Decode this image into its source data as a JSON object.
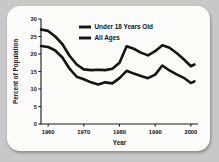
{
  "chart_data": {
    "type": "line",
    "title": "",
    "xlabel": "Year",
    "ylabel": "Percent of Population",
    "xlim": [
      1958,
      2002
    ],
    "ylim": [
      0,
      30
    ],
    "grid": false,
    "legend_position": "top-center",
    "xticks": [
      "1960",
      "1970",
      "1980",
      "1990",
      "2000"
    ],
    "xtick_values": [
      1960,
      1970,
      1980,
      1990,
      2000
    ],
    "yticks": [
      "0",
      "5",
      "10",
      "15",
      "20",
      "25",
      "30"
    ],
    "ytick_values": [
      0,
      5,
      10,
      15,
      20,
      25,
      30
    ],
    "series": [
      {
        "name": "Under 18 Years Old",
        "x": [
          1958,
          1960,
          1962,
          1964,
          1966,
          1968,
          1970,
          1972,
          1974,
          1976,
          1978,
          1980,
          1982,
          1984,
          1986,
          1988,
          1990,
          1992,
          1994,
          1996,
          1998,
          2000,
          2001
        ],
        "values": [
          27.0,
          26.6,
          25.0,
          22.8,
          19.5,
          17.0,
          15.6,
          15.4,
          15.5,
          15.4,
          15.8,
          17.5,
          22.2,
          21.5,
          20.4,
          19.6,
          20.8,
          22.5,
          21.8,
          20.3,
          18.5,
          16.5,
          17.0
        ]
      },
      {
        "name": "All Ages",
        "x": [
          1958,
          1960,
          1962,
          1964,
          1966,
          1968,
          1970,
          1972,
          1974,
          1976,
          1978,
          1980,
          1982,
          1984,
          1986,
          1988,
          1990,
          1992,
          1994,
          1996,
          1998,
          2000,
          2001
        ],
        "values": [
          22.3,
          22.0,
          21.0,
          19.0,
          15.8,
          13.5,
          12.8,
          11.9,
          11.3,
          11.9,
          11.6,
          13.1,
          15.2,
          14.4,
          13.7,
          13.1,
          14.1,
          16.7,
          15.3,
          14.2,
          13.2,
          11.7,
          12.2
        ]
      }
    ]
  },
  "legend": {
    "items": [
      {
        "label": "Under 18 Years Old"
      },
      {
        "label": "All Ages"
      }
    ]
  },
  "axes": {
    "x_title": "Year",
    "y_title": "Percent of Population"
  }
}
